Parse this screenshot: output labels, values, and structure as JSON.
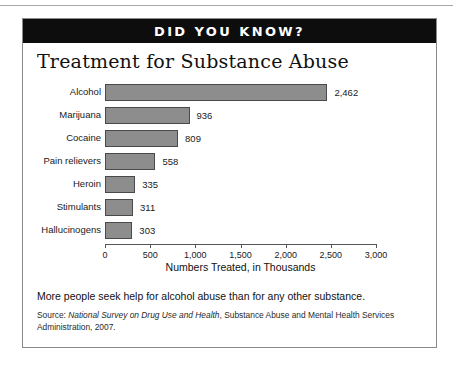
{
  "banner": {
    "label": "DID YOU KNOW?"
  },
  "caption": "More people seek help for alcohol abuse than for any other substance.",
  "source": {
    "prefix": "Source: ",
    "italic": "National Survey on Drug Use and Health",
    "suffix": ", Substance Abuse and Mental Health Services Administration, 2007."
  },
  "chart_data": {
    "type": "bar",
    "orientation": "horizontal",
    "title": "Treatment for Substance Abuse",
    "xlabel": "Numbers Treated, in Thousands",
    "ylabel": "",
    "categories": [
      "Alcohol",
      "Marijuana",
      "Cocaine",
      "Pain relievers",
      "Heroin",
      "Stimulants",
      "Hallucinogens"
    ],
    "values": [
      2462,
      936,
      809,
      558,
      335,
      311,
      303
    ],
    "value_labels": [
      "2,462",
      "936",
      "809",
      "558",
      "335",
      "311",
      "303"
    ],
    "xlim": [
      0,
      3000
    ],
    "xticks": [
      0,
      500,
      1000,
      1500,
      2000,
      2500,
      3000
    ],
    "xtick_labels": [
      "0",
      "500",
      "1,000",
      "1,500",
      "2,000",
      "2,500",
      "3,000"
    ],
    "grid": false,
    "legend": false,
    "bar_color": "#8d8d8d",
    "bar_edge_color": "#4a4a4a"
  }
}
